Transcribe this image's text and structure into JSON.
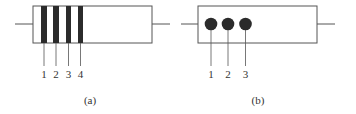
{
  "figure_a": {
    "caption": "(a)",
    "band_labels": [
      "1",
      "2",
      "3",
      "4"
    ],
    "band_color": "#2b2b2b"
  },
  "figure_b": {
    "caption": "(b)",
    "dot_labels": [
      "1",
      "2",
      "3"
    ],
    "dot_color": "#2b2b2b"
  },
  "colors": {
    "stroke": "#555555",
    "background": "#ffffff"
  }
}
